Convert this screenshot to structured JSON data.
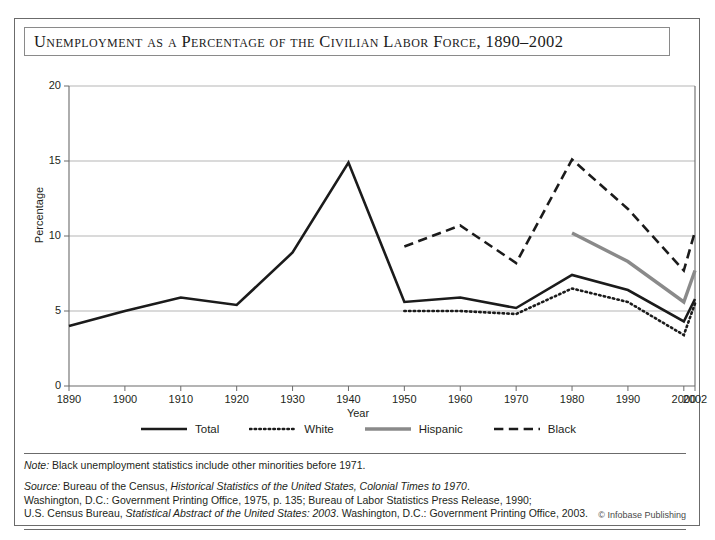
{
  "title": "Unemployment as a Percentage of the Civilian Labor Force, 1890–2002",
  "credit": "© Infobase Publishing",
  "note": {
    "lead": "Note:",
    "text": " Black unemployment statistics include other minorities before 1971."
  },
  "source": {
    "lead": "Source:",
    "line1_a": " Bureau of the Census, ",
    "line1_ital": "Historical Statistics of the United States, Colonial Times to 1970",
    "line1_b": ".",
    "line2": "Washington, D.C.: Government Printing Office, 1975, p. 135; Bureau of Labor Statistics Press Release, 1990;",
    "line3_a": "U.S. Census Bureau, ",
    "line3_ital": "Statistical Abstract of the United States: 2003",
    "line3_b": ". Washington, D.C.: Government Printing Office, 2003."
  },
  "chart_data": {
    "type": "line",
    "title": "Unemployment as a Percentage of the Civilian Labor Force, 1890–2002",
    "xlabel": "Year",
    "ylabel": "Percentage",
    "xlim": [
      1890,
      2002
    ],
    "ylim": [
      0,
      20
    ],
    "yticks": [
      0,
      5,
      10,
      15,
      20
    ],
    "xticks": [
      1890,
      1900,
      1910,
      1920,
      1930,
      1940,
      1950,
      1960,
      1970,
      1980,
      1990,
      2000,
      2002
    ],
    "xtick_labels": [
      "1890",
      "1900",
      "1910",
      "1920",
      "1930",
      "1940",
      "1950",
      "1960",
      "1970",
      "1980",
      "1990",
      "2000",
      "2002"
    ],
    "grid": "horizontal",
    "legend_position": "bottom",
    "series": [
      {
        "name": "Total",
        "color": "#1b1b1b",
        "style": "solid",
        "width": 2.6,
        "x": [
          1890,
          1900,
          1910,
          1920,
          1930,
          1940,
          1950,
          1960,
          1970,
          1980,
          1990,
          2000,
          2002
        ],
        "values": [
          4.0,
          5.0,
          5.9,
          5.4,
          8.9,
          14.9,
          5.6,
          5.9,
          5.2,
          7.4,
          6.4,
          4.3,
          5.8
        ]
      },
      {
        "name": "White",
        "color": "#1b1b1b",
        "style": "dotted",
        "width": 2.6,
        "x": [
          1950,
          1960,
          1970,
          1980,
          1990,
          2000,
          2002
        ],
        "values": [
          5.0,
          5.0,
          4.8,
          6.5,
          5.6,
          3.4,
          5.5
        ]
      },
      {
        "name": "Hispanic",
        "color": "#8a8a8a",
        "style": "solid",
        "width": 3.4,
        "x": [
          1980,
          1990,
          2000,
          2002
        ],
        "values": [
          10.2,
          8.3,
          5.6,
          7.7
        ]
      },
      {
        "name": "Black",
        "color": "#1b1b1b",
        "style": "dashed",
        "width": 2.6,
        "x": [
          1950,
          1960,
          1970,
          1980,
          1990,
          2000,
          2002
        ],
        "values": [
          9.3,
          10.7,
          8.2,
          15.1,
          11.8,
          7.7,
          10.3
        ]
      }
    ]
  }
}
